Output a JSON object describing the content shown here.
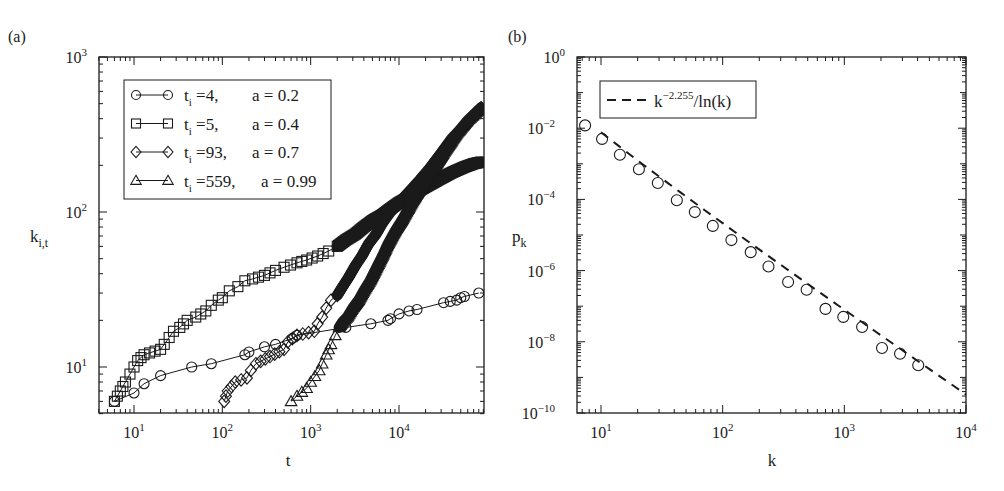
{
  "chart_data": [
    {
      "panel_label": "(a)",
      "type": "scatter",
      "xscale": "log",
      "yscale": "log",
      "xlabel": "t",
      "ylabel": "k_{i,t}",
      "xlim": [
        4,
        90000
      ],
      "ylim": [
        5,
        1000
      ],
      "xticks": [
        {
          "v": 10,
          "base": "10",
          "exp": "1"
        },
        {
          "v": 100,
          "base": "10",
          "exp": "2"
        },
        {
          "v": 1000,
          "base": "10",
          "exp": "3"
        },
        {
          "v": 10000,
          "base": "10",
          "exp": "4"
        }
      ],
      "yticks": [
        {
          "v": 10,
          "base": "10",
          "exp": "1"
        },
        {
          "v": 100,
          "base": "10",
          "exp": "2"
        },
        {
          "v": 1000,
          "base": "10",
          "exp": "3"
        }
      ],
      "grid": false,
      "legend_position": "upper left",
      "series": [
        {
          "name": "t_i=4, a=0.2",
          "legend": {
            "t_label": "t",
            "t_sub": "i",
            "t_val": "=4,",
            "a_label": "a = 0.2"
          },
          "marker": "circle",
          "x": [
            6,
            10,
            13,
            20,
            45,
            75,
            180,
            200,
            300,
            400,
            620,
            700,
            2500,
            4800,
            7500,
            8000,
            10000,
            13000,
            16000,
            32000,
            38000,
            45000,
            50000,
            55000,
            80000
          ],
          "y": [
            6,
            6.8,
            7.8,
            8.8,
            10,
            10.5,
            12,
            12.5,
            13.5,
            14,
            15.3,
            16,
            18,
            19,
            20,
            20.5,
            22,
            23,
            23.5,
            26,
            26.5,
            27,
            28,
            28.5,
            30
          ]
        },
        {
          "name": "t_i=5, a=0.4",
          "legend": {
            "t_label": "t",
            "t_sub": "i",
            "t_val": "=5,",
            "a_label": "a = 0.4"
          },
          "marker": "square",
          "dense": true,
          "x": [
            6,
            7,
            8,
            9,
            10,
            11,
            12,
            13,
            20,
            22,
            25,
            28,
            33,
            40,
            50,
            65,
            75,
            90,
            100,
            120,
            150,
            180,
            220,
            300,
            400,
            500,
            700,
            900,
            1200,
            1600,
            2000,
            2500,
            3200,
            4000,
            5000,
            6500,
            8000,
            10000,
            13000,
            16000,
            20000,
            30000,
            40000,
            55000,
            70000,
            85000
          ],
          "y": [
            6,
            7,
            8,
            9,
            10,
            11,
            11.5,
            12,
            13,
            14,
            15.5,
            17,
            18,
            20,
            21,
            23,
            25,
            27,
            28,
            31,
            33,
            36,
            37,
            39,
            42,
            44,
            47,
            49,
            52,
            56,
            60,
            66,
            72,
            80,
            88,
            96,
            105,
            115,
            125,
            135,
            145,
            165,
            180,
            195,
            205,
            210
          ]
        },
        {
          "name": "t_i=93, a=0.7",
          "legend": {
            "t_label": "t",
            "t_sub": "i",
            "t_val": "=93,",
            "a_label": "a = 0.7"
          },
          "marker": "diamond",
          "dense": true,
          "x": [
            105,
            115,
            140,
            190,
            210,
            240,
            500,
            550,
            700,
            1100,
            1200,
            1350,
            1500,
            1700,
            2000,
            2300,
            2700,
            3200,
            3800,
            4500,
            5500,
            6500,
            8000,
            10000,
            13000,
            17000,
            22000,
            30000,
            40000,
            55000,
            70000,
            85000
          ],
          "y": [
            6,
            7,
            8,
            8.5,
            9.5,
            10.5,
            13,
            14.5,
            16,
            17,
            19,
            21,
            24,
            27,
            29,
            33,
            38,
            45,
            52,
            62,
            72,
            85,
            100,
            115,
            135,
            160,
            190,
            240,
            300,
            360,
            420,
            470
          ]
        },
        {
          "name": "t_i=559, a=0.99",
          "legend": {
            "t_label": "t",
            "t_sub": "i",
            "t_val": "=559,",
            "a_label": "a = 0.99"
          },
          "marker": "triangle",
          "dense": true,
          "x": [
            600,
            700,
            900,
            1000,
            1250,
            1350,
            1500,
            1700,
            1900,
            2100,
            2300,
            2600,
            3000,
            3500,
            4000,
            4700,
            5500,
            6500,
            7500,
            9000,
            11000,
            14000,
            18000,
            24000,
            32000,
            45000,
            60000,
            85000
          ],
          "y": [
            6,
            6.5,
            7.3,
            8,
            9.5,
            10.5,
            12,
            14,
            16,
            18,
            19.5,
            21,
            24,
            27,
            31,
            36,
            43,
            52,
            62,
            75,
            90,
            115,
            145,
            185,
            240,
            320,
            390,
            470
          ]
        }
      ]
    },
    {
      "panel_label": "(b)",
      "type": "scatter",
      "xscale": "log",
      "yscale": "log",
      "xlabel": "k",
      "ylabel": "p_k",
      "xlim": [
        6.3,
        10000
      ],
      "ylim": [
        1e-10,
        1
      ],
      "xticks": [
        {
          "v": 10,
          "base": "10",
          "exp": "1"
        },
        {
          "v": 100,
          "base": "10",
          "exp": "2"
        },
        {
          "v": 1000,
          "base": "10",
          "exp": "3"
        },
        {
          "v": 10000,
          "base": "10",
          "exp": "4"
        }
      ],
      "yticks": [
        {
          "v": 1,
          "base": "10",
          "exp": "0"
        },
        {
          "v": 0.01,
          "base": "10",
          "exp": "−2"
        },
        {
          "v": 0.0001,
          "base": "10",
          "exp": "−4"
        },
        {
          "v": 1e-06,
          "base": "10",
          "exp": "−6"
        },
        {
          "v": 1e-08,
          "base": "10",
          "exp": "−8"
        },
        {
          "v": 1e-10,
          "base": "10",
          "exp": "−10"
        }
      ],
      "grid": false,
      "legend_position": "upper left",
      "series": [
        {
          "name": "empirical p_k",
          "marker": "circle",
          "x": [
            7.4,
            10.2,
            14.3,
            20.5,
            29.3,
            42,
            59,
            83,
            118,
            170,
            238,
            345,
            490,
            700,
            980,
            1400,
            2040,
            2870,
            4050
          ],
          "y": [
            0.012,
            0.005,
            0.0018,
            0.0007,
            0.00029,
            9.5e-05,
            4.4e-05,
            1.8e-05,
            7.2e-06,
            3.3e-06,
            1.3e-06,
            4.8e-07,
            2.9e-07,
            8.4e-08,
            5e-08,
            2.6e-08,
            6.7e-09,
            4.6e-09,
            2.2e-09
          ]
        },
        {
          "name": "k^-2.255/ln(k)",
          "legend": {
            "base": "k",
            "exp": "−2.255",
            "rest": "/ln(k)"
          },
          "style": "dashed",
          "formula": "C * k^-2.255 / ln(k)",
          "exponent": -2.255,
          "C": 3.2,
          "x_range": [
            10,
            10000
          ]
        }
      ]
    }
  ]
}
